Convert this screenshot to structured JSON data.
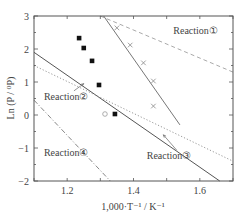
{
  "chart_data": {
    "type": "scatter",
    "title": "",
    "xlabel": "1,000·T⁻¹ / K⁻¹",
    "ylabel": "Ln (P / ⁰P)",
    "xlim": [
      1.1,
      1.7
    ],
    "ylim": [
      -2,
      3
    ],
    "xticks": [
      1.2,
      1.4,
      1.6
    ],
    "xtick_labels": [
      "1.2",
      "1.4",
      "1.6"
    ],
    "yticks": [
      -2,
      -1,
      0,
      1,
      2,
      3
    ],
    "ytick_labels": [
      "−2",
      "−1",
      "0",
      "1",
      "2",
      "3"
    ],
    "grid": false,
    "legend": null,
    "series": [
      {
        "name": "Measured (filled squares)",
        "marker": "square-filled",
        "color": "#111111",
        "x": [
          1.236,
          1.25,
          1.275,
          1.296,
          1.344
        ],
        "y": [
          2.33,
          2.03,
          1.64,
          0.91,
          0.03
        ]
      },
      {
        "name": "Measured (crosses)",
        "marker": "x",
        "color": "#888888",
        "x": [
          1.35,
          1.39,
          1.43,
          1.46,
          1.46
        ],
        "y": [
          2.64,
          2.12,
          1.58,
          1.03,
          0.27
        ]
      },
      {
        "name": "Measured (open circle)",
        "marker": "circle-open",
        "color": "#999999",
        "x": [
          1.314
        ],
        "y": [
          0.03
        ]
      },
      {
        "name": "Fit through crosses",
        "style": "solid",
        "color": "#777777",
        "x": [
          1.31,
          1.54
        ],
        "y": [
          3.0,
          -0.3
        ]
      },
      {
        "name": "Reaction①",
        "style": "dashed",
        "color": "#aaaaaa",
        "x": [
          1.3,
          1.7
        ],
        "y": [
          3.0,
          1.3
        ]
      },
      {
        "name": "Reaction③",
        "style": "solid",
        "color": "#555555",
        "x": [
          1.1,
          1.66
        ],
        "y": [
          1.9,
          -2.0
        ]
      },
      {
        "name": "Reaction②",
        "style": "dotted",
        "color": "#999999",
        "x": [
          1.1,
          1.7
        ],
        "y": [
          1.5,
          -1.4
        ]
      },
      {
        "name": "Reaction④",
        "style": "dash-dot",
        "color": "#888888",
        "x": [
          1.1,
          1.33
        ],
        "y": [
          0.45,
          -2.0
        ]
      }
    ],
    "annotations": [
      {
        "text": "Reaction①",
        "x": 1.52,
        "y": 2.55,
        "arrow": false
      },
      {
        "text": "Reaction②",
        "x": 1.13,
        "y": 0.55,
        "arrow_to": [
          1.25,
          0.95
        ]
      },
      {
        "text": "Reaction③",
        "x": 1.44,
        "y": -1.25,
        "arrow_to": [
          1.49,
          -0.6
        ]
      },
      {
        "text": "Reaction④",
        "x": 1.13,
        "y": -1.15,
        "arrow": false
      }
    ]
  }
}
